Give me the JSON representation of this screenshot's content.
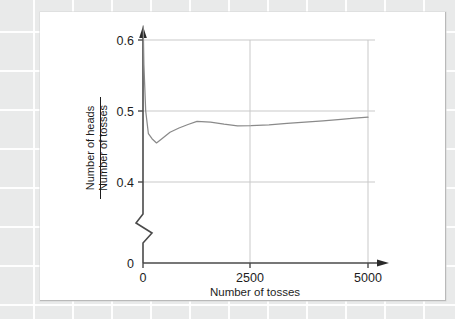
{
  "figure": {
    "background_color": "#e9eaea",
    "card_color": "#ffffff",
    "axis_color": "#2a2a2a",
    "grid_color": "#c9c9c9",
    "series_color": "#8a8a8a"
  },
  "chart_data": {
    "type": "line",
    "title": "",
    "xlabel": "Number of tosses",
    "ylabel_numerator": "Number of heads",
    "ylabel_denominator": "Number of tosses",
    "xlim": [
      0,
      5250
    ],
    "ylim": [
      0.355,
      0.615
    ],
    "xticks": [
      0,
      2500,
      5000
    ],
    "xtick_labels": [
      "0",
      "2500",
      "5000"
    ],
    "yticks": [
      0.4,
      0.5,
      0.6
    ],
    "ytick_labels": [
      "0.4",
      "0.5",
      "0.6"
    ],
    "y_origin_label": "0",
    "y_axis_break": true,
    "grid": true,
    "grid_axis": "both",
    "legend": "none",
    "x_arrow": true,
    "y_arrow": true,
    "series": [
      {
        "name": "proportion of heads",
        "x": [
          5,
          20,
          60,
          120,
          200,
          300,
          420,
          600,
          800,
          1000,
          1200,
          1500,
          1800,
          2100,
          2400,
          2800,
          3200,
          3600,
          4000,
          4400,
          4700,
          5000
        ],
        "y": [
          0.62,
          0.565,
          0.5,
          0.468,
          0.461,
          0.455,
          0.461,
          0.47,
          0.476,
          0.481,
          0.4855,
          0.4845,
          0.4815,
          0.479,
          0.4793,
          0.4805,
          0.4825,
          0.4843,
          0.4862,
          0.4882,
          0.4898,
          0.4913
        ]
      }
    ]
  },
  "axis_labels": {
    "x_label": "Number of tosses",
    "y_label_top": "Number of heads",
    "y_label_bottom": "Number of tosses"
  }
}
